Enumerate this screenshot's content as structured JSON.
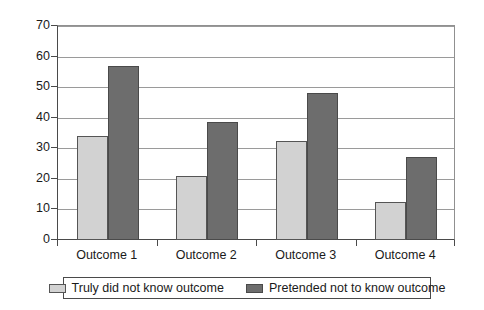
{
  "chart_data": {
    "type": "bar",
    "title": "",
    "subtitle": "",
    "xlabel": "",
    "ylabel": "",
    "categories": [
      "Outcome 1",
      "Outcome 2",
      "Outcome 3",
      "Outcome 4"
    ],
    "series": [
      {
        "name": "Truly did not know outcome",
        "color": "#d2d2d2",
        "values": [
          34,
          21,
          32.5,
          12.5
        ]
      },
      {
        "name": "Pretended not to know outcome",
        "color": "#6d6d6d",
        "values": [
          57,
          38.5,
          48,
          27
        ]
      }
    ],
    "ylim": [
      0,
      70
    ],
    "yticks": [
      0,
      10,
      20,
      30,
      40,
      50,
      60,
      70
    ],
    "ytick_labels": [
      "0",
      "10",
      "20",
      "30",
      "40",
      "50",
      "60",
      "70"
    ],
    "grid": true,
    "grid_axis": "y",
    "legend_position": "bottom",
    "legend_border": true,
    "plot_border": true,
    "annotations": []
  }
}
